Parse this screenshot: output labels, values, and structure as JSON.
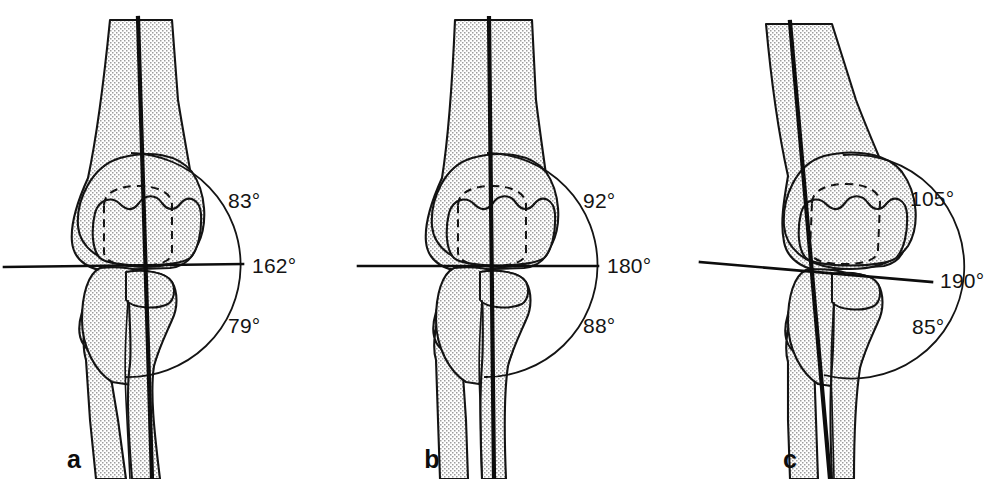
{
  "figure": {
    "background_color": "#ffffff",
    "line_color": "#141414",
    "bone_fill_color": "#dcdcdc",
    "bone_outline_color": "#141414",
    "axis_line_color": "#0d0d0d",
    "panel_count": 3
  },
  "panels": [
    {
      "letter": "a",
      "name": "panel-a",
      "description": "Elbow with varus tilt of the joint line",
      "labels": {
        "upper_angle": "83°",
        "joint_line_angle": "162°",
        "lower_angle": "79°"
      },
      "geometry": {
        "humeral_axis_tilt_deg": -4.5,
        "joint_line_tilt_deg": -1.0,
        "arc_radius": 112
      }
    },
    {
      "letter": "b",
      "name": "panel-b",
      "description": "Normal elbow with straight vertical axis",
      "labels": {
        "upper_angle": "92°",
        "joint_line_angle": "180°",
        "lower_angle": "88°"
      },
      "geometry": {
        "humeral_axis_tilt_deg": 0.6,
        "joint_line_tilt_deg": 0.0,
        "arc_radius": 112
      }
    },
    {
      "letter": "c",
      "name": "panel-c",
      "description": "Elbow with valgus tilt of the joint line",
      "labels": {
        "upper_angle": "105°",
        "joint_line_angle": "190°",
        "lower_angle": "85°"
      },
      "geometry": {
        "humeral_axis_tilt_deg": 9.5,
        "joint_line_tilt_deg": 5.0,
        "arc_radius": 112
      }
    }
  ],
  "anatomy": {
    "humerus": "humerus-shaft",
    "distal_humerus": "distal-humerus-condyles",
    "olecranon_fossa": "olecranon-fossa-dashed",
    "trochlea": "trochlea-capitellum",
    "ulna": "ulna-shaft",
    "radius": "radius-shaft",
    "olecranon": "olecranon-process",
    "radial_head": "radial-head"
  }
}
